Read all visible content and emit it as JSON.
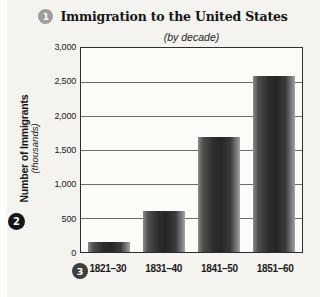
{
  "header": {
    "badge1": "1",
    "title": "Immigration to the United States",
    "subtitle": "(by decade)"
  },
  "y_axis": {
    "badge2": "2",
    "label": "Number of Immigrants",
    "sublabel": "(thousands)",
    "tick_labels": [
      "3,000",
      "2,500",
      "2,000",
      "1,500",
      "1,000",
      "500",
      "0"
    ]
  },
  "x_axis": {
    "badge3": "3"
  },
  "chart_data": {
    "type": "bar",
    "title": "Immigration to the United States",
    "subtitle": "(by decade)",
    "categories": [
      "1821–30",
      "1831–40",
      "1841–50",
      "1851–60"
    ],
    "values": [
      150,
      600,
      1700,
      2600
    ],
    "xlabel": "",
    "ylabel": "Number of Immigrants (thousands)",
    "ylim": [
      0,
      3000
    ],
    "ytick_interval": 500,
    "grid": "horizontal",
    "legend": "none",
    "bar_color": "#2c2c2c"
  },
  "colors": {
    "page_bg": "#f4f3ef",
    "plot_bg": "#fbfbf8",
    "plot_border": "#2e2e2e",
    "gridline": "#6e6e6e",
    "badge1_bg": "#9d9d9d",
    "badge2_bg": "#161616",
    "badge3_bg": "#3f3f3f"
  }
}
